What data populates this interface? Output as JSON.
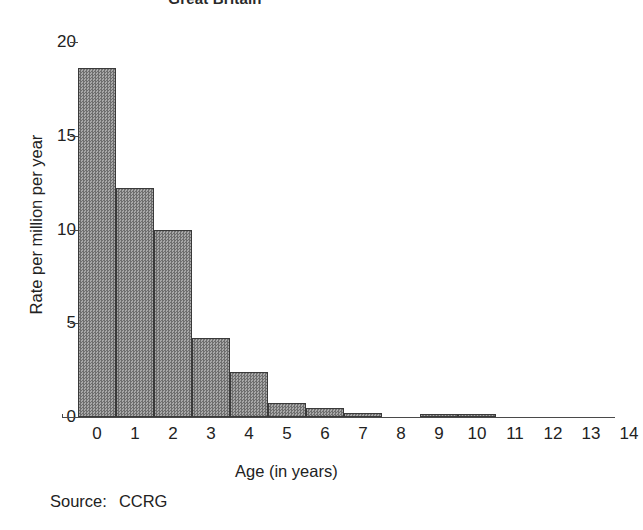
{
  "chart_data": {
    "type": "bar",
    "title": "Great Britain",
    "xlabel": "Age (in years)",
    "ylabel": "Rate per million per year",
    "categories": [
      "0",
      "1",
      "2",
      "3",
      "4",
      "5",
      "6",
      "7",
      "8",
      "9",
      "10",
      "11",
      "12",
      "13",
      "14"
    ],
    "values": [
      18.6,
      12.2,
      10.0,
      4.2,
      2.4,
      0.75,
      0.5,
      0.2,
      0.0,
      0.1,
      0.12,
      0.0,
      0.0,
      0.0,
      0.0
    ],
    "ylim": [
      0,
      20
    ],
    "yticks": [
      0,
      5,
      10,
      15,
      20
    ],
    "ytick_labels": [
      "0",
      "5",
      "10",
      "15",
      "20"
    ],
    "grid": false,
    "legend": null,
    "bar_fill": "#8b8b8b",
    "bar_edge": "#3a3a3a",
    "axis_color": "#4a4a4a",
    "text_color": "#222222"
  },
  "footer": {
    "source_label": "Source:",
    "source_value": "CCRG"
  }
}
